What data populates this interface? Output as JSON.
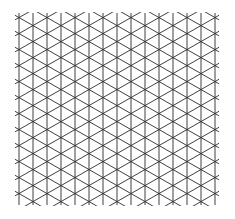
{
  "diagram": {
    "type": "isometric-grid",
    "background": "#ffffff",
    "stroke": "#2b2b2b",
    "stroke_width": 0.9,
    "x0": 19,
    "x_step": 14,
    "columns": 15,
    "y_top": 13,
    "y_bottom": 205,
    "row_step": 16
  }
}
